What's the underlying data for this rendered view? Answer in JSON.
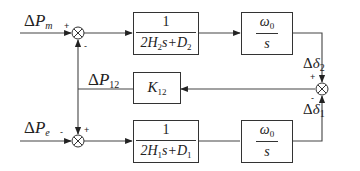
{
  "diagram": {
    "type": "block-diagram",
    "inputs": {
      "top": {
        "delta": "Δ",
        "symbol": "P",
        "subscript": "m"
      },
      "bottom": {
        "delta": "Δ",
        "symbol": "P",
        "subscript": "e"
      }
    },
    "feedback": {
      "delta": "Δ",
      "symbol": "P",
      "subscript": "12"
    },
    "outputs": {
      "top": {
        "delta": "Δ",
        "symbol": "δ",
        "subscript": "2"
      },
      "bottom": {
        "delta": "Δ",
        "symbol": "δ",
        "subscript": "1"
      }
    },
    "blocks": {
      "top_inertia": {
        "numerator": "1",
        "den_pre": "2H",
        "den_sub1": "2",
        "den_mid": "s+D",
        "den_sub2": "2"
      },
      "top_integrator": {
        "num_symbol": "ω",
        "num_sub": "0",
        "denominator": "s"
      },
      "gain": {
        "symbol": "K",
        "subscript": "12"
      },
      "bottom_inertia": {
        "numerator": "1",
        "den_pre": "2H",
        "den_sub1": "1",
        "den_mid": "s+D",
        "den_sub2": "1"
      },
      "bottom_integrator": {
        "num_symbol": "ω",
        "num_sub": "0",
        "denominator": "s"
      }
    },
    "signs": {
      "top_sum_input": "+",
      "top_sum_feedback": "-",
      "bottom_sum_input": "-",
      "bottom_sum_feedback": "+",
      "right_sum_top": "+",
      "right_sum_bottom": "-"
    },
    "colors": {
      "line": "#333333",
      "background": "#ffffff"
    }
  }
}
